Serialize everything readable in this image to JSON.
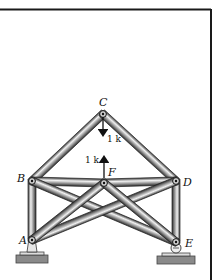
{
  "figure": {
    "frame_color": "#1a1a1a",
    "member_dark": "#555555",
    "member_light": "#e8e8e8",
    "joints": {
      "A": {
        "label": "A",
        "x": 32,
        "y": 240
      },
      "B": {
        "label": "B",
        "x": 32,
        "y": 181
      },
      "C": {
        "label": "C",
        "x": 103,
        "y": 114
      },
      "D": {
        "label": "D",
        "x": 176,
        "y": 181
      },
      "E": {
        "label": "E",
        "x": 176,
        "y": 242
      },
      "F": {
        "label": "F",
        "x": 104,
        "y": 183
      }
    },
    "members": [
      [
        "A",
        "B"
      ],
      [
        "B",
        "C"
      ],
      [
        "C",
        "D"
      ],
      [
        "D",
        "E"
      ],
      [
        "B",
        "F"
      ],
      [
        "F",
        "D"
      ],
      [
        "B",
        "E"
      ],
      [
        "D",
        "A"
      ],
      [
        "F",
        "A"
      ],
      [
        "F",
        "E"
      ]
    ],
    "loads": [
      {
        "joint": "C",
        "direction": "down",
        "label": "1 k"
      },
      {
        "joint": "F",
        "direction": "up",
        "label": "1 k"
      }
    ],
    "supports": [
      {
        "joint": "A",
        "type": "pin"
      },
      {
        "joint": "E",
        "type": "roller"
      }
    ]
  }
}
